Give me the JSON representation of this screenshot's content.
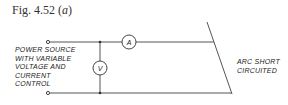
{
  "figure": {
    "caption_prefix": "Fig. 4.52 (",
    "caption_letter": "a",
    "caption_suffix": ")"
  },
  "labels": {
    "source_lines": [
      "POWER SOURCE",
      "WITH VARIABLE",
      "VOLTAGE AND",
      "CURRENT",
      "CONTROL"
    ],
    "arc_lines": [
      "ARC SHORT",
      "CIRCUITED"
    ]
  },
  "meters": {
    "ammeter": "A",
    "voltmeter": "V"
  }
}
